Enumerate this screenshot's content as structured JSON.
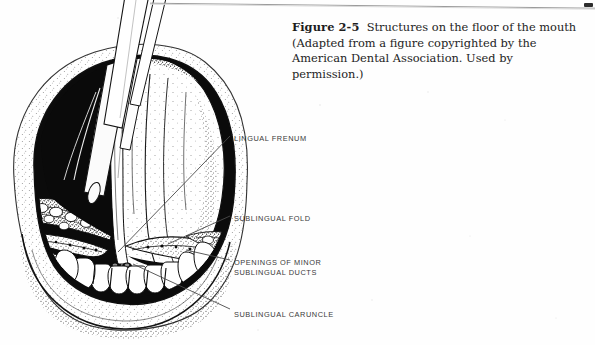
{
  "figure": {
    "caption_number": "Figure 2-5",
    "caption_text": "Structures on the floor of the mouth (Adapted from a figure copyrighted by the American Dental Association. Used by permission.)",
    "illustration_name": "floor-of-mouth-anatomical-drawing",
    "illustration_description": "Black and white stippled line drawing of an open mouth viewed from the front with the tongue retracted upward by an instrument, exposing the floor of the mouth, lower teeth arch and sublingual structures.",
    "style": {
      "ink_color": "#0d0d0d",
      "paper_color": "#fefefe",
      "leader_line_color": "#4a4a4a"
    }
  },
  "labels": [
    {
      "id": "lingual-frenum",
      "text": "LINGUAL FRENUM",
      "lines": [
        "LINGUAL FRENUM"
      ],
      "x": 234,
      "y": 138
    },
    {
      "id": "sublingual-fold",
      "text": "SUBLINGUAL FOLD",
      "lines": [
        "SUBLINGUAL FOLD"
      ],
      "x": 234,
      "y": 217
    },
    {
      "id": "openings-of-minor-sublingual-ducts",
      "text": "OPENINGS OF MINOR SUBLINGUAL DUCTS",
      "lines": [
        "OPENINGS OF MINOR",
        "SUBLINGUAL DUCTS"
      ],
      "x": 234,
      "y": 262
    },
    {
      "id": "sublingual-caruncle",
      "text": "SUBLINGUAL CARUNCLE",
      "lines": [
        "SUBLINGUAL CARUNCLE"
      ],
      "x": 234,
      "y": 313
    }
  ],
  "label_strings": {
    "lingual_frenum": "LINGUAL FRENUM",
    "sublingual_fold": "SUBLINGUAL FOLD",
    "openings_line1": "OPENINGS OF MINOR",
    "openings_line2": "SUBLINGUAL DUCTS",
    "sublingual_caruncle": "SUBLINGUAL CARUNCLE"
  }
}
